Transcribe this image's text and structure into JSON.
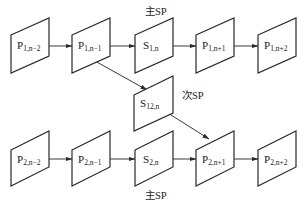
{
  "diagram": {
    "row1": [
      {
        "main": "P",
        "sub": "1,n−2"
      },
      {
        "main": "P",
        "sub": "1,n−1"
      },
      {
        "main": "S",
        "sub": "1,n"
      },
      {
        "main": "P",
        "sub": "1,n+1"
      },
      {
        "main": "P",
        "sub": "1,n+2"
      }
    ],
    "middle": {
      "main": "S",
      "sub": "12,n"
    },
    "row2": [
      {
        "main": "P",
        "sub": "2,n−2"
      },
      {
        "main": "P",
        "sub": "2,n−1"
      },
      {
        "main": "S",
        "sub": "2,n"
      },
      {
        "main": "P",
        "sub": "2,n+1"
      },
      {
        "main": "P",
        "sub": "2,n+2"
      }
    ],
    "labels": {
      "top_primary_sp": "主SP",
      "secondary_sp": "次SP",
      "bottom_primary_sp": "主SP"
    },
    "colors": {
      "stroke": "#2a2a2a",
      "background": "#ffffff"
    }
  }
}
